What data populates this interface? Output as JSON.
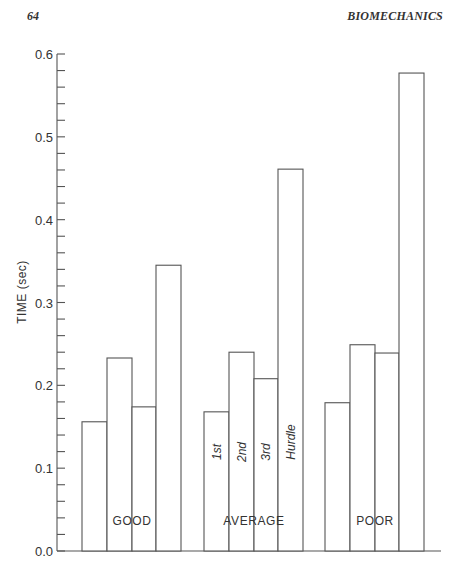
{
  "page": {
    "page_number": "64",
    "running_head": "BIOMECHANICS"
  },
  "chart_data": {
    "type": "bar",
    "title": "",
    "xlabel": "",
    "ylabel": "TIME (sec)",
    "ylim": [
      0.0,
      0.6
    ],
    "yticks": [
      "0.0",
      "0.1",
      "0.2",
      "0.3",
      "0.4",
      "0.5",
      "0.6"
    ],
    "minor_tick_step": 0.02,
    "grid": false,
    "legend": null,
    "categories": [
      "GOOD",
      "AVERAGE",
      "POOR"
    ],
    "bar_labels": [
      "1st",
      "2nd",
      "3rd",
      "Hurdle"
    ],
    "bar_labels_shown_in_group": "AVERAGE",
    "series": [
      {
        "name": "1st",
        "values": [
          0.156,
          0.168,
          0.179
        ]
      },
      {
        "name": "2nd",
        "values": [
          0.233,
          0.24,
          0.249
        ]
      },
      {
        "name": "3rd",
        "values": [
          0.174,
          0.208,
          0.239
        ]
      },
      {
        "name": "Hurdle",
        "values": [
          0.345,
          0.461,
          0.577
        ]
      }
    ],
    "colors": {
      "bar_fill": "#ffffff",
      "bar_stroke": "#555555"
    }
  }
}
